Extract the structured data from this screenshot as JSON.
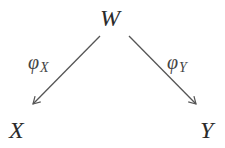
{
  "diagram": {
    "nodes": {
      "top": "W",
      "left": "X",
      "right": "Y"
    },
    "edges": [
      {
        "from": "W",
        "to": "X",
        "label_main": "φ",
        "label_sub": "X"
      },
      {
        "from": "W",
        "to": "Y",
        "label_main": "φ",
        "label_sub": "Y"
      }
    ],
    "colors": {
      "arrow": "#555555",
      "text": "#2b2b2b"
    }
  }
}
